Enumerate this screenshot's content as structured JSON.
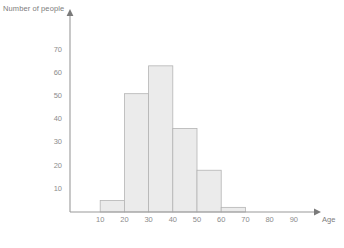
{
  "chart_data": {
    "type": "bar",
    "title": "",
    "xlabel": "Age",
    "ylabel": "Number of people",
    "categories": [
      "10-20",
      "20-30",
      "30-40",
      "40-50",
      "50-60",
      "60-70"
    ],
    "bin_edges": [
      10,
      20,
      30,
      40,
      50,
      60,
      70
    ],
    "values": [
      5,
      51,
      63,
      36,
      18,
      2
    ],
    "xtick_labels": [
      "10",
      "20",
      "30",
      "40",
      "50",
      "60",
      "70",
      "80",
      "90"
    ],
    "xtick_values": [
      10,
      20,
      30,
      40,
      50,
      60,
      70,
      80,
      90
    ],
    "ytick_labels": [
      "10",
      "20",
      "30",
      "40",
      "50",
      "60",
      "70"
    ],
    "ytick_values": [
      10,
      20,
      30,
      40,
      50,
      60,
      70
    ],
    "xlim": [
      0,
      100
    ],
    "ylim": [
      0,
      78
    ],
    "grid": false,
    "legend": null,
    "colors": {
      "bar_fill": "#ebebeb",
      "bar_stroke": "#b4b4b4",
      "axis": "#9a9a9a",
      "text": "#8a8a8a",
      "background": "#ffffff"
    }
  }
}
